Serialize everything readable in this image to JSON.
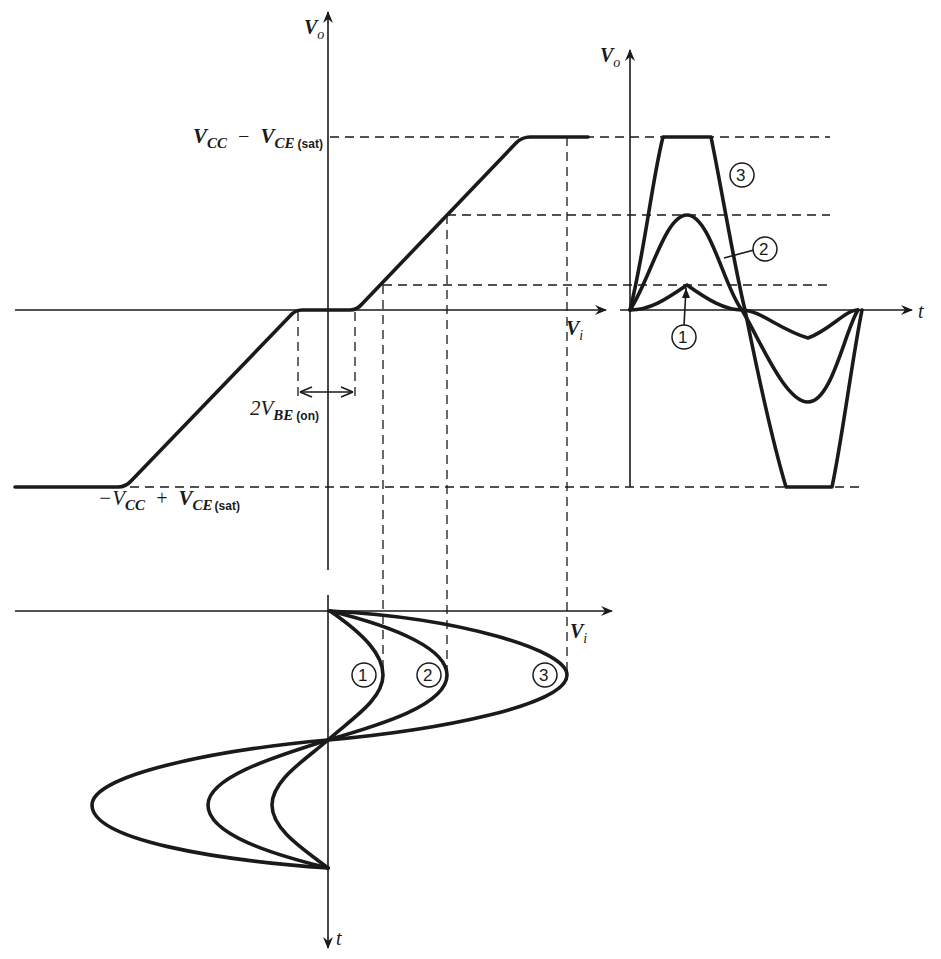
{
  "figure": {
    "transfer_plot": {
      "y_axis_label": "V",
      "y_axis_sub": "o",
      "x_axis_label": "V",
      "x_axis_sub": "i",
      "upper_limit_label": {
        "a": "V",
        "a_sub": "CC",
        "op": "−",
        "b": "V",
        "b_sub": "CE",
        "b_paren": "(sat)"
      },
      "lower_limit_label": {
        "prefix": "−V",
        "a_sub": "CC",
        "op": "+",
        "b": "V",
        "b_sub": "CE",
        "b_paren": "(sat)"
      },
      "deadband_label": {
        "coef": "2V",
        "sub": "BE",
        "paren": "(on)"
      }
    },
    "output_plot": {
      "y_axis_label": "V",
      "y_axis_sub": "o",
      "x_axis_label": "t",
      "curve_labels": [
        "1",
        "2",
        "3"
      ]
    },
    "input_plot": {
      "x_axis_label": "V",
      "x_axis_sub": "i",
      "y_axis_label": "t",
      "curve_labels": [
        "1",
        "2",
        "3"
      ]
    }
  }
}
